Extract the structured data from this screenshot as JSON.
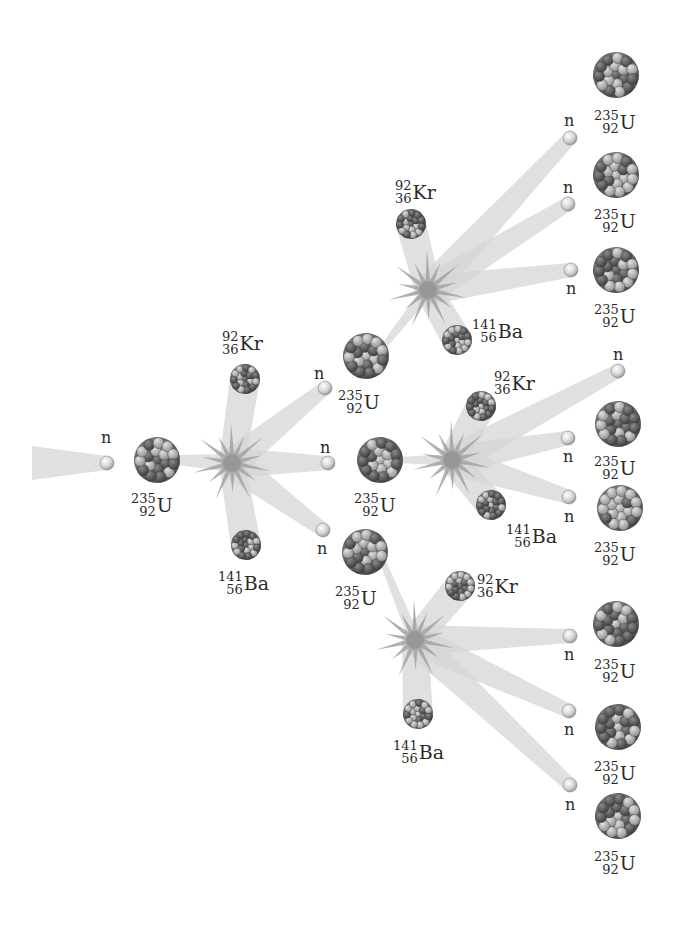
{
  "colors": {
    "background": "#ffffff",
    "beam": "#d4d4d4",
    "flash": "#9a9a9a",
    "neutron": "#cfcfcf",
    "nucleus_dark": "#555555",
    "nucleus_light": "#a8a8a8",
    "text": "#2a2a2a"
  },
  "labels": {
    "neutron": "n",
    "uranium": {
      "mass": "235",
      "atomic": "92",
      "symbol": "U"
    },
    "krypton": {
      "mass": "92",
      "atomic": "36",
      "symbol": "Kr"
    },
    "barium": {
      "mass": "141",
      "atomic": "56",
      "symbol": "Ba"
    }
  },
  "incoming_neutron": {
    "x": 107,
    "y": 463,
    "label_x": 101,
    "label_y": 430
  },
  "initial_uranium": {
    "x": 157,
    "y": 460,
    "r": 23,
    "label_x": 131,
    "label_y": 490
  },
  "generations": [
    {
      "id": "gen1",
      "flash": {
        "x": 232,
        "y": 463
      },
      "krypton": {
        "x": 245,
        "y": 379,
        "r": 15,
        "label_x": 222,
        "label_y": 328
      },
      "barium": {
        "x": 246,
        "y": 545,
        "r": 15,
        "label_x": 218,
        "label_y": 568
      },
      "neutrons": [
        {
          "x": 325,
          "y": 388,
          "label_x": 314,
          "label_y": 366
        },
        {
          "x": 328,
          "y": 463,
          "label_x": 320,
          "label_y": 440
        },
        {
          "x": 323,
          "y": 530,
          "label_x": 317,
          "label_y": 541
        }
      ]
    },
    {
      "id": "gen2-top",
      "flash": {
        "x": 428,
        "y": 290
      },
      "krypton": {
        "x": 411,
        "y": 224,
        "r": 15,
        "label_x": 395,
        "label_y": 177
      },
      "barium": {
        "x": 457,
        "y": 340,
        "r": 15,
        "label_x": 472,
        "label_y": 316
      },
      "neutrons": [
        {
          "x": 570,
          "y": 138,
          "label_x": 564,
          "label_y": 113
        },
        {
          "x": 568,
          "y": 204,
          "label_x": 563,
          "label_y": 180
        },
        {
          "x": 571,
          "y": 270,
          "label_x": 566,
          "label_y": 281
        }
      ]
    },
    {
      "id": "gen2-mid",
      "flash": {
        "x": 452,
        "y": 460
      },
      "krypton": {
        "x": 481,
        "y": 406,
        "r": 15,
        "label_x": 494,
        "label_y": 368
      },
      "barium": {
        "x": 491,
        "y": 505,
        "r": 15,
        "label_x": 506,
        "label_y": 521
      },
      "neutrons": [
        {
          "x": 618,
          "y": 371,
          "label_x": 613,
          "label_y": 347
        },
        {
          "x": 568,
          "y": 438,
          "label_x": 563,
          "label_y": 449
        },
        {
          "x": 569,
          "y": 497,
          "label_x": 564,
          "label_y": 509
        }
      ]
    },
    {
      "id": "gen2-bot",
      "flash": {
        "x": 415,
        "y": 640
      },
      "krypton": {
        "x": 460,
        "y": 586,
        "r": 15,
        "label_x": 477,
        "label_y": 571
      },
      "barium": {
        "x": 418,
        "y": 714,
        "r": 15,
        "label_x": 393,
        "label_y": 737
      },
      "neutrons": [
        {
          "x": 570,
          "y": 636,
          "label_x": 564,
          "label_y": 647
        },
        {
          "x": 569,
          "y": 711,
          "label_x": 564,
          "label_y": 722
        },
        {
          "x": 570,
          "y": 785,
          "label_x": 565,
          "label_y": 797
        }
      ]
    }
  ],
  "gen1_targets": [
    {
      "x": 366,
      "y": 356,
      "r": 23,
      "label_x": 338,
      "label_y": 387
    },
    {
      "x": 380,
      "y": 460,
      "r": 23,
      "label_x": 354,
      "label_y": 490
    },
    {
      "x": 365,
      "y": 552,
      "r": 23,
      "label_x": 335,
      "label_y": 583
    }
  ],
  "gen2_targets": [
    {
      "x": 616,
      "y": 75,
      "r": 23,
      "label_x": 594,
      "label_y": 107
    },
    {
      "x": 616,
      "y": 175,
      "r": 23,
      "label_x": 594,
      "label_y": 206
    },
    {
      "x": 616,
      "y": 270,
      "r": 23,
      "label_x": 594,
      "label_y": 301
    },
    {
      "x": 618,
      "y": 424,
      "r": 23,
      "label_x": 594,
      "label_y": 453
    },
    {
      "x": 620,
      "y": 508,
      "r": 23,
      "label_x": 594,
      "label_y": 539
    },
    {
      "x": 616,
      "y": 624,
      "r": 23,
      "label_x": 594,
      "label_y": 656
    },
    {
      "x": 618,
      "y": 727,
      "r": 23,
      "label_x": 594,
      "label_y": 758
    },
    {
      "x": 618,
      "y": 816,
      "r": 23,
      "label_x": 594,
      "label_y": 848
    }
  ]
}
